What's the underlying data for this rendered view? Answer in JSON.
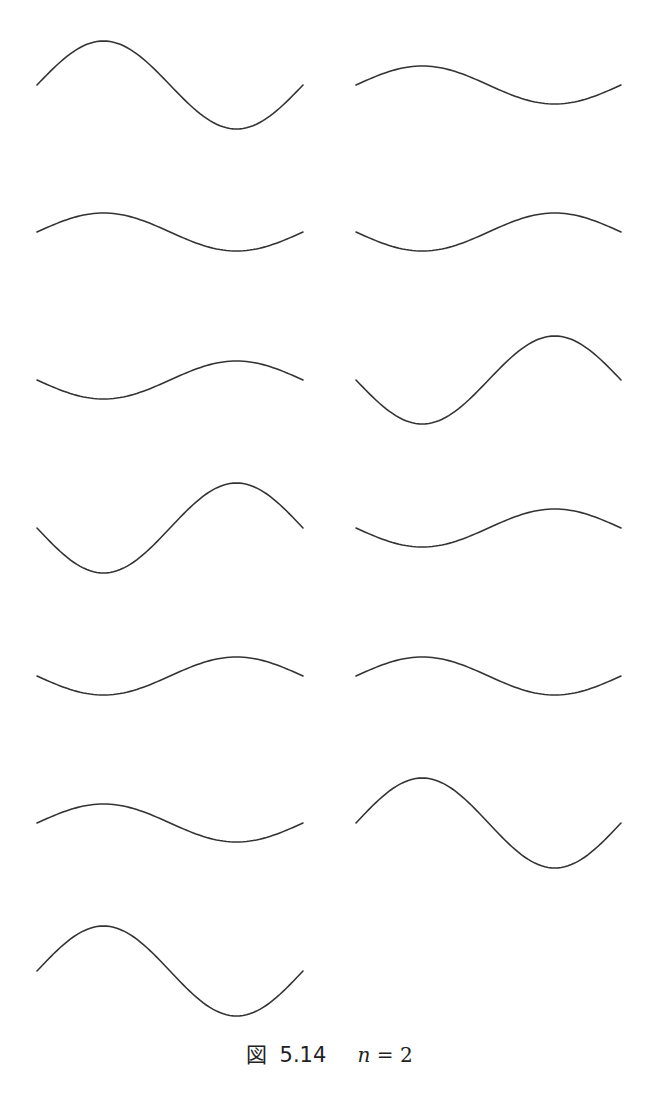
{
  "figure": {
    "caption": {
      "label": "図",
      "number": "5.14",
      "math_var": "n",
      "math_rest": " = 2"
    },
    "stroke_color": "#333333",
    "stroke_width": 1.6
  },
  "chart_data": {
    "type": "line",
    "title": "図 5.14  n = 2",
    "xlabel": "",
    "ylabel": "",
    "grid": false,
    "axes_visible": false,
    "layout": "7 rows x 2 columns grid of small multiples (13 panels, last row has only left panel)",
    "panels": [
      {
        "row": 0,
        "col": 0,
        "x0": 37,
        "x1": 303,
        "center_y": 85,
        "amplitude": 44,
        "shape": "peak-first"
      },
      {
        "row": 0,
        "col": 1,
        "x0": 356,
        "x1": 621,
        "center_y": 85,
        "amplitude": 19,
        "shape": "peak-first"
      },
      {
        "row": 1,
        "col": 0,
        "x0": 37,
        "x1": 303,
        "center_y": 232,
        "amplitude": 19,
        "shape": "peak-first"
      },
      {
        "row": 1,
        "col": 1,
        "x0": 356,
        "x1": 621,
        "center_y": 232,
        "amplitude": 19,
        "shape": "trough-first"
      },
      {
        "row": 2,
        "col": 0,
        "x0": 37,
        "x1": 303,
        "center_y": 380,
        "amplitude": 19,
        "shape": "trough-first"
      },
      {
        "row": 2,
        "col": 1,
        "x0": 356,
        "x1": 621,
        "center_y": 380,
        "amplitude": 44,
        "shape": "trough-first"
      },
      {
        "row": 3,
        "col": 0,
        "x0": 37,
        "x1": 303,
        "center_y": 528,
        "amplitude": 45,
        "shape": "trough-first"
      },
      {
        "row": 3,
        "col": 1,
        "x0": 356,
        "x1": 621,
        "center_y": 528,
        "amplitude": 19,
        "shape": "trough-first"
      },
      {
        "row": 4,
        "col": 0,
        "x0": 37,
        "x1": 303,
        "center_y": 676,
        "amplitude": 19,
        "shape": "trough-first"
      },
      {
        "row": 4,
        "col": 1,
        "x0": 356,
        "x1": 621,
        "center_y": 676,
        "amplitude": 19,
        "shape": "peak-first"
      },
      {
        "row": 5,
        "col": 0,
        "x0": 37,
        "x1": 303,
        "center_y": 823,
        "amplitude": 19,
        "shape": "peak-first"
      },
      {
        "row": 5,
        "col": 1,
        "x0": 356,
        "x1": 621,
        "center_y": 823,
        "amplitude": 45,
        "shape": "peak-first"
      },
      {
        "row": 6,
        "col": 0,
        "x0": 37,
        "x1": 303,
        "center_y": 971,
        "amplitude": 45,
        "shape": "peak-first"
      }
    ]
  }
}
